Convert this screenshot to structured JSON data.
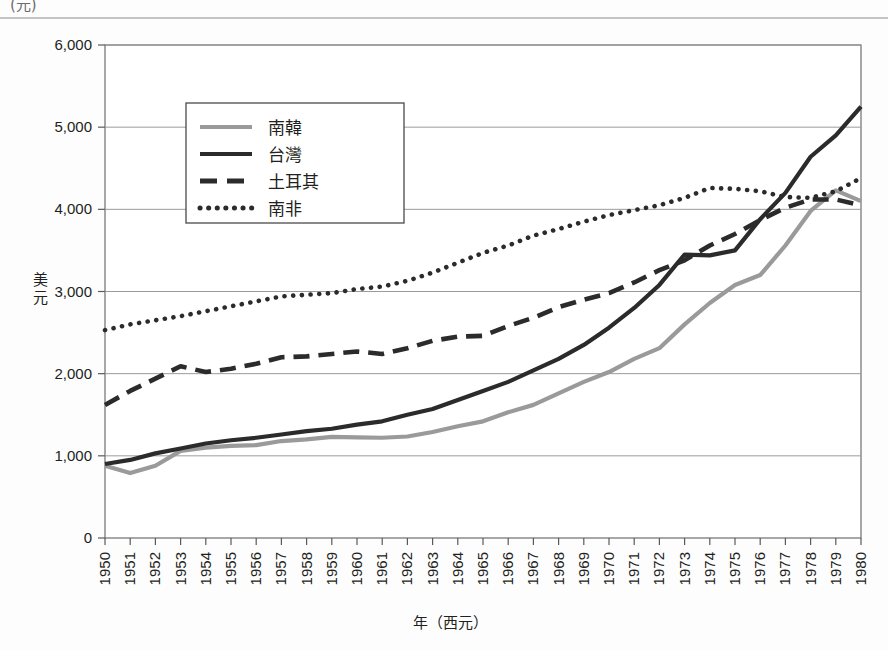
{
  "chart_data": {
    "type": "line",
    "title": "",
    "xlabel": "年（西元）",
    "ylabel": "美元",
    "ylim": [
      0,
      6000
    ],
    "ytick_step": 1000,
    "yticks": [
      "0",
      "1,000",
      "2,000",
      "3,000",
      "4,000",
      "5,000",
      "6,000"
    ],
    "grid": true,
    "legend_position": "upper-left-inside",
    "categories": [
      "1950",
      "1951",
      "1952",
      "1953",
      "1954",
      "1955",
      "1956",
      "1957",
      "1958",
      "1959",
      "1960",
      "1961",
      "1962",
      "1963",
      "1964",
      "1965",
      "1966",
      "1967",
      "1968",
      "1969",
      "1970",
      "1971",
      "1972",
      "1973",
      "1974",
      "1975",
      "1976",
      "1977",
      "1978",
      "1979",
      "1980"
    ],
    "series": [
      {
        "name": "南韓",
        "style": "solid",
        "color": "#9a9a9a",
        "values": [
          880,
          790,
          880,
          1060,
          1100,
          1120,
          1130,
          1180,
          1200,
          1230,
          1225,
          1220,
          1235,
          1290,
          1360,
          1420,
          1530,
          1620,
          1760,
          1900,
          2020,
          2180,
          2310,
          2600,
          2860,
          3080,
          3200,
          3560,
          3980,
          4230,
          4100
        ]
      },
      {
        "name": "台灣",
        "style": "solid",
        "color": "#2b2b2b",
        "values": [
          900,
          950,
          1030,
          1090,
          1150,
          1190,
          1220,
          1260,
          1300,
          1330,
          1380,
          1420,
          1500,
          1570,
          1680,
          1790,
          1900,
          2040,
          2180,
          2350,
          2560,
          2800,
          3080,
          3450,
          3440,
          3500,
          3880,
          4200,
          4640,
          4900,
          5250
        ]
      },
      {
        "name": "土耳其",
        "style": "dashed",
        "color": "#2b2b2b",
        "values": [
          1620,
          1790,
          1940,
          2090,
          2020,
          2060,
          2120,
          2200,
          2210,
          2240,
          2270,
          2240,
          2310,
          2400,
          2450,
          2460,
          2580,
          2680,
          2810,
          2900,
          2980,
          3110,
          3260,
          3380,
          3560,
          3700,
          3870,
          4020,
          4120,
          4120,
          4050
        ]
      },
      {
        "name": "南非",
        "style": "dotted",
        "color": "#2b2b2b",
        "values": [
          2530,
          2600,
          2650,
          2700,
          2760,
          2820,
          2880,
          2940,
          2960,
          2980,
          3030,
          3060,
          3130,
          3230,
          3350,
          3470,
          3560,
          3680,
          3760,
          3850,
          3930,
          3990,
          4050,
          4140,
          4260,
          4250,
          4220,
          4150,
          4140,
          4220,
          4380
        ]
      }
    ]
  },
  "figure": {
    "clipped_header": "(元)",
    "legend_entries": [
      "南韓",
      "台灣",
      "土耳其",
      "南非"
    ]
  }
}
